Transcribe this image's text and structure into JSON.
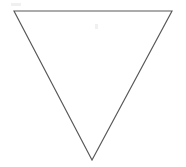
{
  "figure": {
    "shape_name": "inverted-triangle",
    "orientation": "point-down",
    "background_color": "#ffffff",
    "stroke_color": "#585858",
    "fill_color": "#ffffff",
    "stroke_width": "1.15",
    "canvas": {
      "width": 186,
      "height": 167
    },
    "vertices": [
      {
        "label": "top-left",
        "x": 14,
        "y": 11
      },
      {
        "label": "top-right",
        "x": 172,
        "y": 11
      },
      {
        "label": "bottom-apex",
        "x": 92,
        "y": 160
      }
    ],
    "points_attr": "14,11 172,11 92,160",
    "edges": [
      {
        "label": "top-edge",
        "from": "top-left",
        "to": "top-right"
      },
      {
        "label": "right-edge",
        "from": "top-right",
        "to": "bottom-apex"
      },
      {
        "label": "left-edge",
        "from": "bottom-apex",
        "to": "top-left"
      }
    ],
    "artifacts": [
      {
        "label": "speck-upper-left",
        "x": 11,
        "y": 3,
        "width": 10,
        "height": 3
      },
      {
        "label": "speck-interior",
        "x": 95,
        "y": 24,
        "width": 3,
        "height": 5
      }
    ]
  }
}
